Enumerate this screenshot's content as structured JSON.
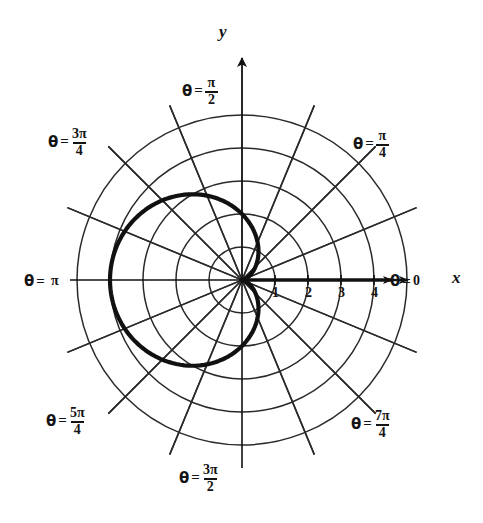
{
  "figure": {
    "title": "",
    "axis_labels": {
      "x": "x",
      "y": "y"
    },
    "center": {
      "x": 242,
      "y": 280
    },
    "unit_px": 33
  },
  "chart_data": {
    "type": "line",
    "coordinate_system": "polar",
    "title": "",
    "xlabel": "x",
    "ylabel": "y",
    "curve_name": "cardioid",
    "curve_equation": "r = 2(1 - cos θ)",
    "grid": true,
    "radial_gridlines": [
      1,
      2,
      3,
      4,
      5
    ],
    "radial_tick_labels": [
      "1",
      "2",
      "3",
      "4"
    ],
    "angular_gridline_count": 16,
    "angular_step_degrees": 22.5,
    "theta_range_degrees": [
      0,
      360
    ],
    "r_max": 4,
    "theta": [
      0,
      22.5,
      45,
      67.5,
      90,
      112.5,
      135,
      157.5,
      180,
      202.5,
      225,
      247.5,
      270,
      292.5,
      315,
      337.5,
      360
    ],
    "r": [
      0.0,
      0.152,
      0.586,
      1.235,
      2.0,
      2.765,
      3.414,
      3.848,
      4.0,
      3.848,
      3.414,
      2.765,
      2.0,
      1.235,
      0.586,
      0.152,
      0.0
    ]
  },
  "angle_labels": [
    {
      "id": "theta-0",
      "theta_symbol": "θ",
      "equals": "=",
      "value": "0",
      "numerator": "",
      "denominator": "",
      "is_fraction": false
    },
    {
      "id": "theta-pi-4",
      "theta_symbol": "θ",
      "equals": "=",
      "value": "",
      "numerator": "π",
      "denominator": "4",
      "is_fraction": true
    },
    {
      "id": "theta-pi-2",
      "theta_symbol": "θ",
      "equals": "=",
      "value": "",
      "numerator": "π",
      "denominator": "2",
      "is_fraction": true
    },
    {
      "id": "theta-3pi-4",
      "theta_symbol": "θ",
      "equals": "=",
      "value": "",
      "numerator": "3π",
      "denominator": "4",
      "is_fraction": true
    },
    {
      "id": "theta-pi",
      "theta_symbol": "θ",
      "equals": "=",
      "value": "π",
      "numerator": "",
      "denominator": "",
      "is_fraction": false
    },
    {
      "id": "theta-5pi-4",
      "theta_symbol": "θ",
      "equals": "=",
      "value": "",
      "numerator": "5π",
      "denominator": "4",
      "is_fraction": true
    },
    {
      "id": "theta-3pi-2",
      "theta_symbol": "θ",
      "equals": "=",
      "value": "",
      "numerator": "3π",
      "denominator": "2",
      "is_fraction": true
    },
    {
      "id": "theta-7pi-4",
      "theta_symbol": "θ",
      "equals": "=",
      "value": "",
      "numerator": "7π",
      "denominator": "4",
      "is_fraction": true
    }
  ],
  "tick_numbers": [
    "1",
    "2",
    "3",
    "4"
  ],
  "colors": {
    "background": "#ffffff",
    "grid": "#2a2a2a",
    "axis": "#111111",
    "curve": "#111111",
    "text": "#141414"
  }
}
